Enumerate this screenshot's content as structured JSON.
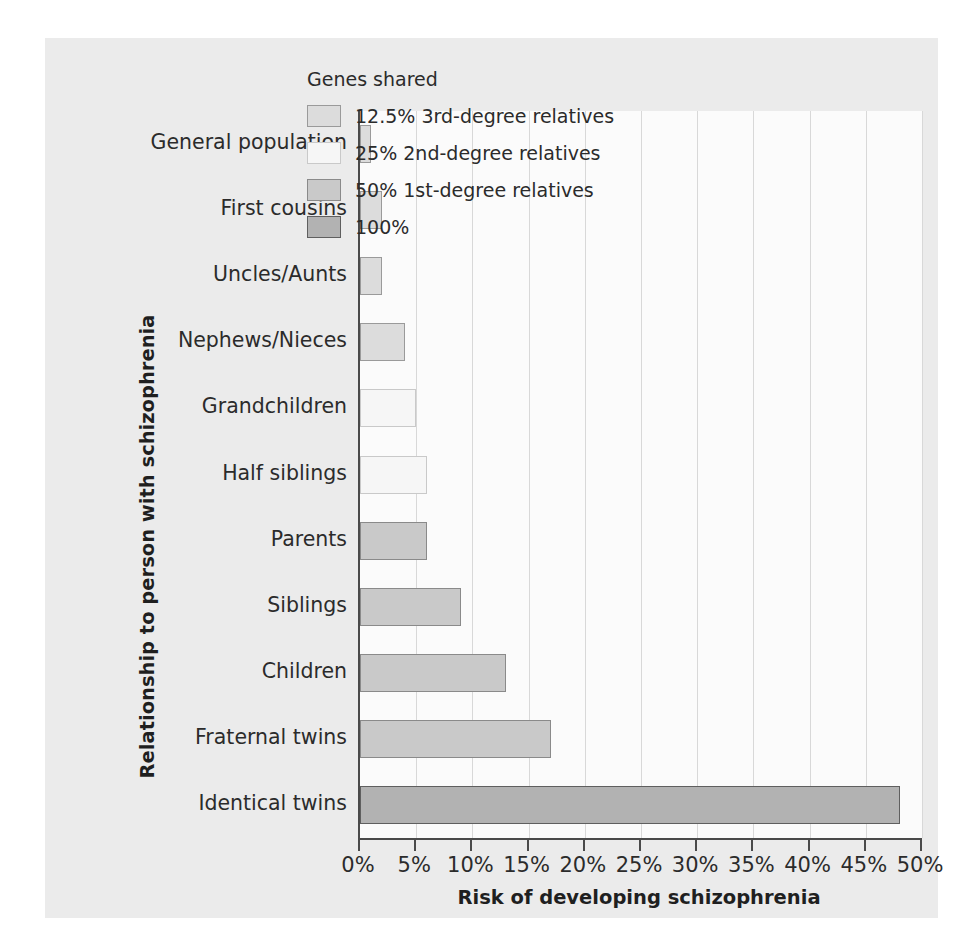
{
  "chart_data": {
    "type": "bar",
    "orientation": "horizontal",
    "title": "",
    "xlabel": "Risk of developing schizophrenia",
    "ylabel": "Relationship to person with schizophrenia",
    "xlim": [
      0,
      50
    ],
    "xunit": "%",
    "grid": true,
    "legend_position": "top-right-inside",
    "categories": [
      "General population",
      "First cousins",
      "Uncles/Aunts",
      "Nephews/Nieces",
      "Grandchildren",
      "Half siblings",
      "Parents",
      "Siblings",
      "Children",
      "Fraternal twins",
      "Identical twins"
    ],
    "values": [
      1,
      2,
      2,
      4,
      5,
      6,
      6,
      9,
      13,
      17,
      48
    ],
    "group_keys": [
      "g125",
      "g125",
      "g125",
      "g125",
      "g25",
      "g25",
      "g50",
      "g50",
      "g50",
      "g50",
      "g100"
    ],
    "xticks": [
      0,
      5,
      10,
      15,
      20,
      25,
      30,
      35,
      40,
      45,
      50
    ],
    "xticklabels": [
      "0%",
      "5%",
      "10%",
      "15%",
      "20%",
      "25%",
      "30%",
      "35%",
      "40%",
      "45%",
      "50%"
    ],
    "legend": {
      "title": "Genes shared",
      "entries": [
        {
          "key": "g125",
          "label": "12.5% 3rd-degree relatives",
          "color": "#dcdcdc"
        },
        {
          "key": "g25",
          "label": "25% 2nd-degree relatives",
          "color": "#f6f6f6"
        },
        {
          "key": "g50",
          "label": "50% 1st-degree relatives",
          "color": "#c9c9c9"
        },
        {
          "key": "g100",
          "label": "100%",
          "color": "#b2b2b2"
        }
      ]
    },
    "colors": {
      "panel_background": "#ebebeb",
      "plot_background": "#fbfbfb",
      "axis": "#4a4a4a",
      "gridline": "#d8d8d8",
      "text": "#2b2b2b"
    }
  }
}
